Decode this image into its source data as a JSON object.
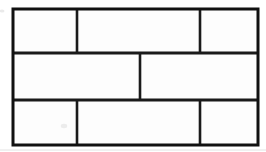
{
  "figure": {
    "background_color": "#ffffff",
    "line_color": "#1a1a1a",
    "cell_fill_color": "#fdfdfd",
    "smudge_color": "#d8d8d8",
    "faint_line_color": "#e2e2e2"
  },
  "wall": {
    "label": "wall-outline",
    "x": 13,
    "y": 9,
    "width": 245,
    "height": 136,
    "border_width": 3
  },
  "rows": [
    {
      "label": "row-top",
      "y_top": 9,
      "y_bottom": 53,
      "bricks": [
        {
          "label": "brick-top-left",
          "x": 13,
          "width": 64
        },
        {
          "label": "brick-top-middle",
          "x": 77,
          "width": 123
        },
        {
          "label": "brick-top-right",
          "x": 200,
          "width": 58
        }
      ]
    },
    {
      "label": "row-middle",
      "y_top": 53,
      "y_bottom": 100,
      "bricks": [
        {
          "label": "brick-middle-left",
          "x": 13,
          "width": 127
        },
        {
          "label": "brick-middle-right",
          "x": 140,
          "width": 118
        }
      ]
    },
    {
      "label": "row-bottom",
      "y_top": 100,
      "y_bottom": 145,
      "bricks": [
        {
          "label": "brick-bottom-left",
          "x": 13,
          "width": 64
        },
        {
          "label": "brick-bottom-middle",
          "x": 77,
          "width": 123
        },
        {
          "label": "brick-bottom-right",
          "x": 200,
          "width": 58
        }
      ]
    }
  ],
  "row_separators": [
    {
      "label": "row-separator-upper",
      "y": 53,
      "x1": 13,
      "x2": 258,
      "width": 3
    },
    {
      "label": "row-separator-lower",
      "y": 100,
      "x1": 13,
      "x2": 258,
      "width": 3
    }
  ],
  "vertical_dividers": [
    {
      "label": "divider-top-1",
      "x": 77,
      "y1": 9,
      "y2": 53,
      "width": 2.6
    },
    {
      "label": "divider-top-2",
      "x": 200,
      "y1": 9,
      "y2": 53,
      "width": 2.6
    },
    {
      "label": "divider-middle-1",
      "x": 140,
      "y1": 53,
      "y2": 100,
      "width": 2.6
    },
    {
      "label": "divider-bottom-1",
      "x": 77,
      "y1": 100,
      "y2": 145,
      "width": 2.6
    },
    {
      "label": "divider-bottom-2",
      "x": 200,
      "y1": 100,
      "y2": 145,
      "width": 2.6
    }
  ],
  "artifacts": [
    {
      "label": "smudge-top-left",
      "x": 2,
      "y": 11,
      "rx": 2.5,
      "ry": 1.6,
      "opacity": 0.55
    },
    {
      "label": "smudge-bottom-left",
      "x": 64,
      "y": 126,
      "rx": 3.2,
      "ry": 2.2,
      "opacity": 0.45
    },
    {
      "label": "scan-line-bottom",
      "y": 150,
      "x1": 0,
      "x2": 266
    }
  ]
}
